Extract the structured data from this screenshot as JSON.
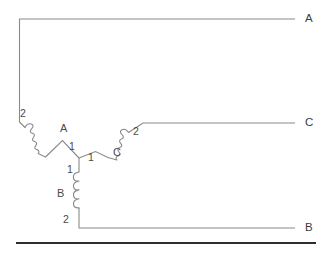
{
  "diagram": {
    "background_color": "#ffffff",
    "wire_color": "#8a8a8a",
    "rule_color": "#2e2e2e",
    "phase_lines": [
      {
        "id": "line-a",
        "label": "A",
        "label_x": 305,
        "label_y": 13
      },
      {
        "id": "line-c",
        "label": "C",
        "label_x": 305,
        "label_y": 117
      },
      {
        "id": "line-b",
        "label": "B",
        "label_x": 305,
        "label_y": 222
      }
    ],
    "coils": [
      {
        "id": "coil-a",
        "label": "A",
        "label_x": 60,
        "label_y": 123,
        "start_terminal": "2",
        "start_terminal_x": 20,
        "start_terminal_y": 108,
        "end_terminal": "1",
        "end_terminal_x": 69,
        "end_terminal_y": 141,
        "connects_to": "A"
      },
      {
        "id": "coil-b",
        "label": "B",
        "label_x": 57,
        "label_y": 188,
        "start_terminal": "1",
        "start_terminal_x": 67,
        "start_terminal_y": 164,
        "end_terminal": "2",
        "end_terminal_x": 63,
        "end_terminal_y": 214,
        "connects_to": "B"
      },
      {
        "id": "coil-c",
        "label": "C",
        "label_x": 113,
        "label_y": 147,
        "start_terminal": "1",
        "start_terminal_x": 88,
        "start_terminal_y": 152,
        "end_terminal": "2",
        "end_terminal_x": 133,
        "end_terminal_y": 126,
        "connects_to": "C"
      }
    ],
    "star_point": {
      "x": 79,
      "y": 158
    }
  }
}
